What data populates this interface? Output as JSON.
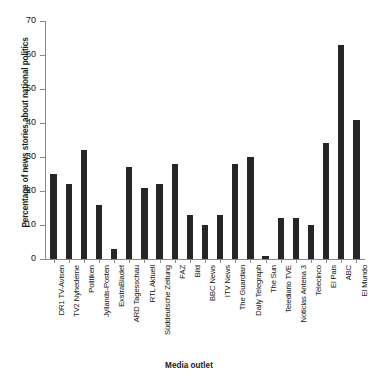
{
  "chart_data": {
    "type": "bar",
    "title": "",
    "xlabel": "Media outlet",
    "ylabel": "Percentage of news stories about national politics",
    "ylim": [
      0,
      70
    ],
    "yticks": [
      0,
      10,
      20,
      30,
      40,
      50,
      60,
      70
    ],
    "grid": false,
    "legend": "none",
    "bar_color": "#262626",
    "categories": [
      "DR1 TV-Avisen",
      "TV2 Nyhederne",
      "Politiken",
      "Jyllands-Posten",
      "ExstraBladet",
      "ARD Tagesschau",
      "RTL Aktuell",
      "Süddeutsche Zeitung",
      "FAZ",
      "Bild",
      "BBC News",
      "ITV News",
      "The Guardian",
      "Daily Telegraph",
      "The Sun",
      "Telediario TVE",
      "Noticias Antena 3",
      "Telecinco",
      "El Pais",
      "ABC",
      "El Mundo"
    ],
    "values": [
      25,
      22,
      32,
      16,
      3,
      27,
      21,
      22,
      28,
      13,
      10,
      13,
      28,
      30,
      1,
      12,
      12,
      10,
      34,
      63,
      41
    ]
  }
}
